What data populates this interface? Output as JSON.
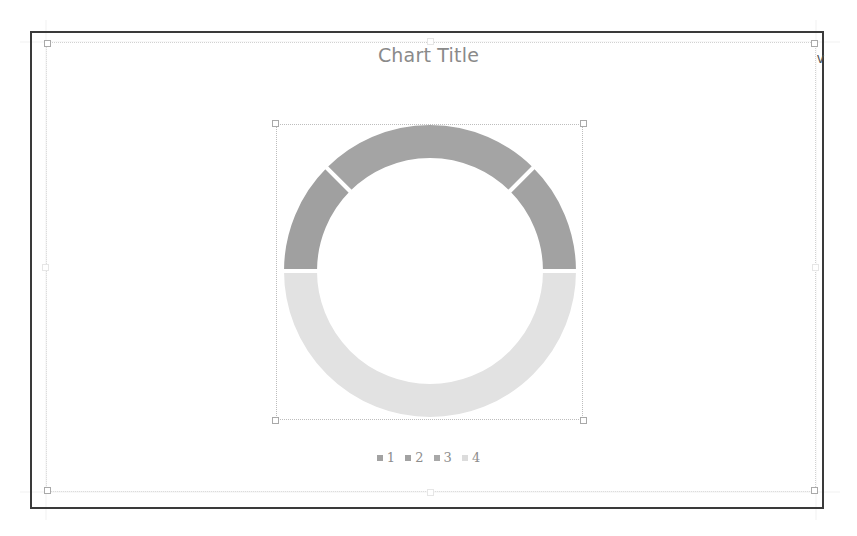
{
  "chart": {
    "title": "Chart Title",
    "clipped_cell_text": "v"
  },
  "legend": {
    "items": [
      {
        "label": "1",
        "color": "#a2a2a2"
      },
      {
        "label": "2",
        "color": "#a2a2a2"
      },
      {
        "label": "3",
        "color": "#a8a8a8"
      },
      {
        "label": "4",
        "color": "#dcdcdc"
      }
    ]
  },
  "colors": {
    "series_1": "#a0a0a0",
    "series_2": "#a4a4a4",
    "series_3": "#a2a2a2",
    "series_4": "#e2e2e2",
    "frame": "#3a3a3a",
    "title": "#8a8a8a"
  },
  "chart_data": {
    "type": "donut",
    "title": "Chart Title",
    "categories": [
      "1",
      "2",
      "3",
      "4"
    ],
    "values": [
      25,
      50,
      25,
      100
    ],
    "start_angle_deg": 270,
    "hole_ratio": 0.75,
    "legend_position": "bottom",
    "note": "Half-donut gauge style: series 1-3 form the upper semicircle, series 4 fills the lower semicircle"
  }
}
